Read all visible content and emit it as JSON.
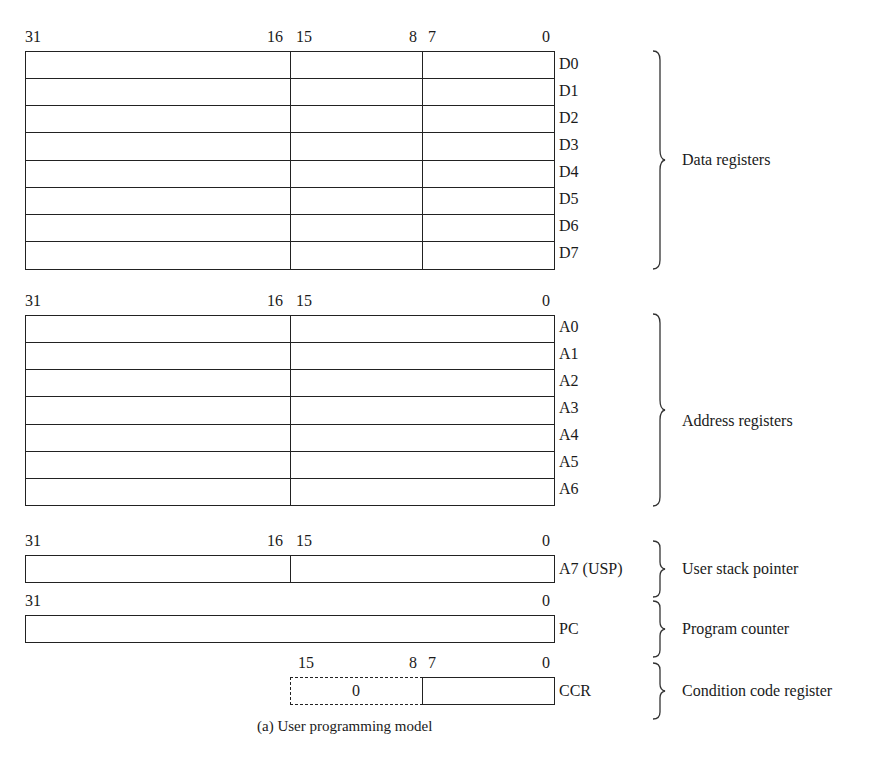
{
  "figure": {
    "caption": "(a) User programming model"
  },
  "data_registers": {
    "bits": {
      "b31": "31",
      "b16": "16",
      "b15": "15",
      "b8": "8",
      "b7": "7",
      "b0": "0"
    },
    "names": [
      "D0",
      "D1",
      "D2",
      "D3",
      "D4",
      "D5",
      "D6",
      "D7"
    ],
    "group_label": "Data registers"
  },
  "address_registers": {
    "bits": {
      "b31": "31",
      "b16": "16",
      "b15": "15",
      "b0": "0"
    },
    "names": [
      "A0",
      "A1",
      "A2",
      "A3",
      "A4",
      "A5",
      "A6"
    ],
    "group_label": "Address registers"
  },
  "stack_pointer": {
    "bits": {
      "b31": "31",
      "b16": "16",
      "b15": "15",
      "b0": "0"
    },
    "name": "A7 (USP)",
    "group_label": "User stack pointer"
  },
  "program_counter": {
    "bits": {
      "b31": "31",
      "b0": "0"
    },
    "name": "PC",
    "group_label": "Program counter"
  },
  "condition_code": {
    "bits": {
      "b15": "15",
      "b8": "8",
      "b7": "7",
      "b0": "0"
    },
    "upper_value": "0",
    "name": "CCR",
    "group_label": "Condition code register"
  }
}
